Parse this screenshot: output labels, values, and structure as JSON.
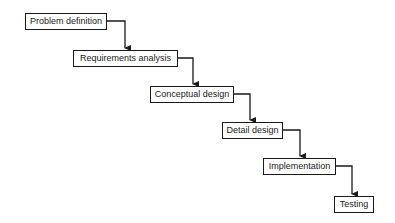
{
  "diagram": {
    "type": "waterfall-process",
    "colors": {
      "stroke": "#1a1a1a",
      "background": "#ffffff",
      "text": "#1a1a1a"
    },
    "steps": [
      {
        "label": "Problem definition"
      },
      {
        "label": "Requirements analysis"
      },
      {
        "label": "Conceptual design"
      },
      {
        "label": "Detail design"
      },
      {
        "label": "Implementation"
      },
      {
        "label": "Testing"
      }
    ],
    "edges": [
      {
        "from": "Problem definition",
        "to": "Requirements analysis"
      },
      {
        "from": "Requirements analysis",
        "to": "Conceptual design"
      },
      {
        "from": "Conceptual design",
        "to": "Detail design"
      },
      {
        "from": "Detail design",
        "to": "Implementation"
      },
      {
        "from": "Implementation",
        "to": "Testing"
      }
    ]
  }
}
